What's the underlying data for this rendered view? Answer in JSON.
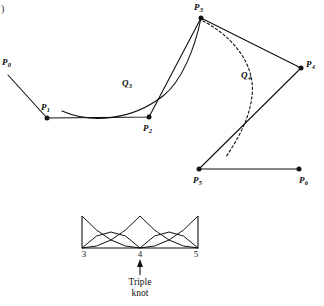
{
  "figure": {
    "corner_mark": ")",
    "background": "#ffffff",
    "stroke_color": "#111111",
    "control_polygon": {
      "points": [
        {
          "id": "P0",
          "label": "P",
          "sub": "0",
          "x": 8,
          "y": 75,
          "dot": false,
          "label_x": 2,
          "label_y": 58
        },
        {
          "id": "P1",
          "label": "P",
          "sub": "1",
          "x": 47,
          "y": 118,
          "dot": true,
          "label_x": 41,
          "label_y": 103
        },
        {
          "id": "P2",
          "label": "P",
          "sub": "2",
          "x": 149,
          "y": 117,
          "dot": true,
          "label_x": 143,
          "label_y": 124
        },
        {
          "id": "P3",
          "label": "P",
          "sub": "3",
          "x": 201,
          "y": 18,
          "dot": true,
          "label_x": 194,
          "label_y": 3
        },
        {
          "id": "P4",
          "label": "P",
          "sub": "4",
          "x": 301,
          "y": 68,
          "dot": true,
          "label_x": 306,
          "label_y": 60
        },
        {
          "id": "P5",
          "label": "P",
          "sub": "5",
          "x": 199,
          "y": 169,
          "dot": true,
          "label_x": 193,
          "label_y": 176
        },
        {
          "id": "P6",
          "label": "P",
          "sub": "6",
          "x": 299,
          "y": 169,
          "dot": true,
          "label_x": 299,
          "label_y": 176
        }
      ]
    },
    "curves": [
      {
        "id": "Q3",
        "label": "Q",
        "sub": "3",
        "style": "solid",
        "label_x": 122,
        "label_y": 79
      },
      {
        "id": "Q4",
        "label": "Q",
        "sub": "4",
        "style": "dashed",
        "label_x": 241,
        "label_y": 71
      }
    ]
  },
  "basis_plot": {
    "axis": {
      "x_left": 82,
      "x_right": 198,
      "baseline_y": 248,
      "top_y": 216
    },
    "ticks": [
      {
        "value": "3",
        "x": 84,
        "y": 250
      },
      {
        "value": "4",
        "x": 140,
        "y": 250
      },
      {
        "value": "5",
        "x": 196,
        "y": 250
      }
    ],
    "annotation": {
      "line1": "Triple",
      "line2": "knot",
      "arrow_x": 140,
      "text_x": 140,
      "text_y": 277
    }
  },
  "chart_data": {
    "type": "line",
    "xlabel": "",
    "ylabel": "",
    "xlim": [
      3,
      5
    ],
    "ylim": [
      0,
      1
    ],
    "grid": false,
    "legend": "none",
    "annotations": [
      {
        "text": "Triple knot",
        "x": 4,
        "y": 0
      }
    ],
    "tick_labels": [
      "3",
      "4",
      "5"
    ],
    "knot_vector": [
      3,
      3,
      3,
      4,
      4,
      4,
      5,
      5,
      5
    ],
    "series": [
      {
        "name": "N0",
        "x": [
          3.0,
          3.25,
          3.5,
          3.75,
          4.0
        ],
        "values": [
          1.0,
          0.5625,
          0.25,
          0.0625,
          0.0
        ]
      },
      {
        "name": "N1",
        "x": [
          3.0,
          3.25,
          3.5,
          3.75,
          4.0
        ],
        "values": [
          0.0,
          0.375,
          0.5,
          0.375,
          0.0
        ]
      },
      {
        "name": "N2",
        "x": [
          3.0,
          3.25,
          3.5,
          3.75,
          4.0
        ],
        "values": [
          0.0,
          0.0625,
          0.25,
          0.5625,
          1.0
        ]
      },
      {
        "name": "N3",
        "x": [
          4.0,
          4.25,
          4.5,
          4.75,
          5.0
        ],
        "values": [
          1.0,
          0.5625,
          0.25,
          0.0625,
          0.0
        ]
      },
      {
        "name": "N4",
        "x": [
          4.0,
          4.25,
          4.5,
          4.75,
          5.0
        ],
        "values": [
          0.0,
          0.375,
          0.5,
          0.375,
          0.0
        ]
      },
      {
        "name": "N5",
        "x": [
          4.0,
          4.25,
          4.5,
          4.75,
          5.0
        ],
        "values": [
          0.0,
          0.0625,
          0.25,
          0.5625,
          1.0
        ]
      }
    ]
  }
}
